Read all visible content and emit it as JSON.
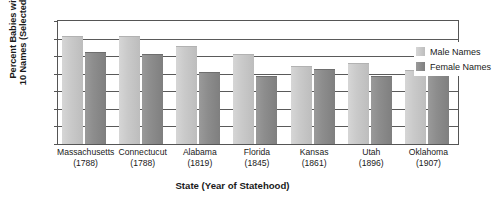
{
  "chart_data": {
    "type": "bar",
    "title": "",
    "xlabel": "State (Year of Statehood)",
    "ylabel": "Percent Babies  with Top 10 Names (Selected States)",
    "ylabel_lines": [
      "Percent Babies  with Top",
      "10 Names (Selected States)"
    ],
    "categories": [
      "Massachusetts (1788)",
      "Connectucut (1788)",
      "Alabama (1819)",
      "Florida (1845)",
      "Kansas (1861)",
      "Utah (1896)",
      "Oklahoma (1907)"
    ],
    "category_states": [
      "Massachusetts",
      "Connectucut",
      "Alabama",
      "Florida",
      "Kansas",
      "Utah",
      "Oklahoma"
    ],
    "category_years": [
      "(1788)",
      "(1788)",
      "(1819)",
      "(1845)",
      "(1861)",
      "(1896)",
      "(1907)"
    ],
    "series": [
      {
        "name": "Male Names",
        "color": "#c8c8c8",
        "values": [
          12.3,
          12.3,
          11.2,
          10.2,
          8.9,
          9.2,
          8.4
        ]
      },
      {
        "name": "Female Names",
        "color": "#8a8a8a",
        "values": [
          10.5,
          10.2,
          8.2,
          7.7,
          8.5,
          7.7,
          7.8
        ]
      }
    ],
    "ylim": [
      0,
      14
    ],
    "yticks": [
      0,
      2,
      4,
      6,
      8,
      10,
      12,
      14
    ],
    "ytick_labels": [
      "0",
      "2",
      "4",
      "6",
      "8",
      "10",
      "12",
      "14"
    ],
    "grid": true,
    "grid_axis": "y",
    "legend_position": "top-right"
  },
  "legend": {
    "items": [
      {
        "label": "Male Names",
        "swatch": "male-swatch"
      },
      {
        "label": "Female Names",
        "swatch": "female-swatch"
      }
    ]
  }
}
